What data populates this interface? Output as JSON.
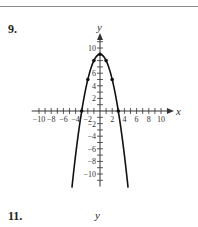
{
  "exercises": [
    {
      "label": "9."
    },
    {
      "label": "11.",
      "axis_label": "y"
    }
  ],
  "chart_data": {
    "type": "line",
    "title": "",
    "xlabel": "x",
    "ylabel": "y",
    "function": "y = 9 - x^2",
    "x_ticks": [
      -10,
      -8,
      -6,
      -4,
      -2,
      2,
      4,
      6,
      8,
      10
    ],
    "y_ticks": [
      10,
      8,
      6,
      4,
      2,
      -2,
      -4,
      -6,
      -8,
      -10
    ],
    "x_tick_labels": [
      "−10",
      "−8",
      "−6",
      "−4",
      "−2",
      "2",
      "4",
      "6",
      "8",
      "10"
    ],
    "y_tick_labels": [
      "10",
      "6",
      "4",
      "2",
      "−2",
      "−4",
      "−6",
      "−8",
      "−10"
    ],
    "xlim": [
      -11,
      11
    ],
    "ylim": [
      -12,
      11
    ],
    "grid": false,
    "points": [
      {
        "x": -3,
        "y": 0
      },
      {
        "x": -2,
        "y": 5
      },
      {
        "x": -1,
        "y": 8
      },
      {
        "x": 0,
        "y": 9
      },
      {
        "x": 1,
        "y": 8
      },
      {
        "x": 2,
        "y": 5
      },
      {
        "x": 3,
        "y": 0
      }
    ],
    "curve_domain": [
      -4.6,
      4.6
    ]
  }
}
